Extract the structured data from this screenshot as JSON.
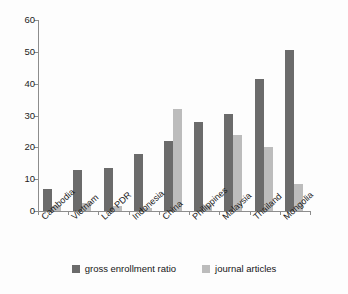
{
  "chart_data": {
    "type": "bar",
    "title": "",
    "xlabel": "",
    "ylabel": "",
    "ylim": [
      0,
      60
    ],
    "yticks": [
      0,
      10,
      20,
      30,
      40,
      50,
      60
    ],
    "grid": false,
    "legend_position": "bottom-center",
    "categories": [
      "Cambodia",
      "Vietnam",
      "Lao PDR",
      "Indonesia",
      "China",
      "Philippines",
      "Malaysia",
      "Thailand",
      "Mongolia"
    ],
    "series": [
      {
        "name": "gross enrollment ratio",
        "color": "#6b6b6b",
        "values": [
          7,
          13,
          13.5,
          18,
          22,
          28,
          30.5,
          41.5,
          50.5
        ]
      },
      {
        "name": "journal articles",
        "color": "#bcbcbc",
        "values": [
          1.5,
          2.5,
          1.7,
          1,
          32,
          2,
          24,
          20,
          8.5
        ]
      }
    ]
  },
  "axis": {
    "y_tick_labels": [
      "0",
      "10",
      "20",
      "30",
      "40",
      "50",
      "60"
    ]
  },
  "legend": {
    "items": [
      {
        "label": "gross enrollment ratio",
        "swatch": "dark-gray-swatch"
      },
      {
        "label": "journal articles",
        "swatch": "light-gray-swatch"
      }
    ]
  }
}
